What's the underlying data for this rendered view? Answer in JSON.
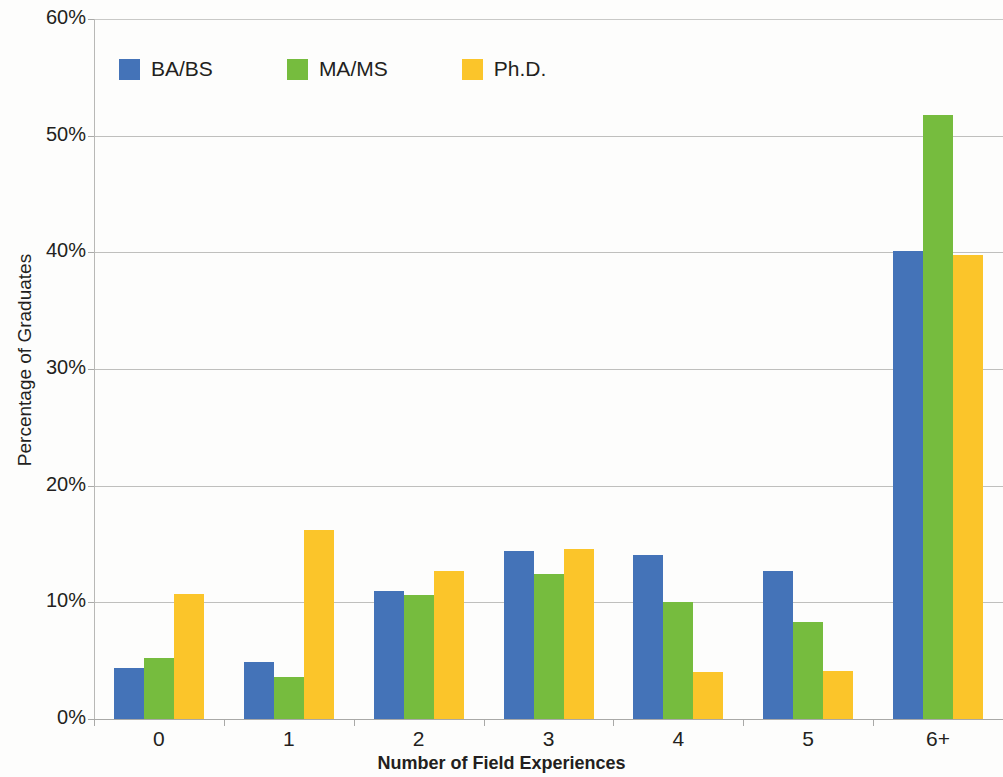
{
  "chart_data": {
    "type": "bar",
    "title": "",
    "xlabel": "Number of Field Experiences",
    "ylabel": "Percentage of Graduates",
    "categories": [
      "0",
      "1",
      "2",
      "3",
      "4",
      "5",
      "6+"
    ],
    "ylim": [
      0,
      60
    ],
    "y_ticks": [
      "0%",
      "10%",
      "20%",
      "30%",
      "40%",
      "50%",
      "60%"
    ],
    "y_tick_values": [
      0,
      10,
      20,
      30,
      40,
      50,
      60
    ],
    "grid": true,
    "legend_position": "top-left",
    "series": [
      {
        "name": "BA/BS",
        "color": "#4473b8",
        "values": [
          4.4,
          4.9,
          11.0,
          14.4,
          14.1,
          12.7,
          40.1
        ]
      },
      {
        "name": "MA/MS",
        "color": "#76bc3e",
        "values": [
          5.2,
          3.6,
          10.6,
          12.4,
          10.0,
          8.3,
          51.8
        ]
      },
      {
        "name": "Ph.D.",
        "color": "#fbc52a",
        "values": [
          10.7,
          16.2,
          12.7,
          14.6,
          4.0,
          4.1,
          39.8
        ]
      }
    ]
  }
}
